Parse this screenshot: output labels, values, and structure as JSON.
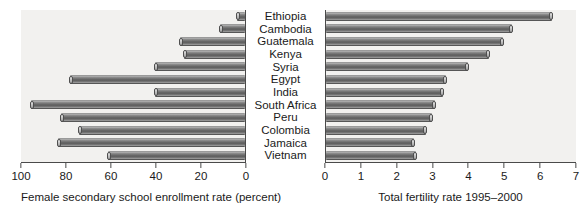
{
  "chart_data": [
    {
      "id": "female-enrollment",
      "type": "bar",
      "orientation": "horizontal",
      "direction": "right-to-left",
      "title": "",
      "xlabel": "Female secondary school enrollment rate (percent)",
      "ylabel": "",
      "xlim": [
        100,
        0
      ],
      "xticks": [
        100,
        80,
        60,
        40,
        20,
        0
      ],
      "xtick_labels": [
        "100",
        "80",
        "60",
        "40",
        "20",
        "0"
      ],
      "grid": false,
      "legend": false,
      "categories": [
        "Ethiopia",
        "Cambodia",
        "Guatemala",
        "Kenya",
        "Syria",
        "Egypt",
        "India",
        "South Africa",
        "Peru",
        "Colombia",
        "Jamaica",
        "Vietnam"
      ],
      "values": [
        3.5,
        11,
        29,
        27,
        40,
        78,
        40,
        95,
        82,
        74,
        83,
        61
      ]
    },
    {
      "id": "total-fertility",
      "type": "bar",
      "orientation": "horizontal",
      "direction": "left-to-right",
      "title": "",
      "xlabel": "Total fertility rate 1995–2000",
      "ylabel": "",
      "xlim": [
        0,
        7
      ],
      "xticks": [
        0,
        1,
        2,
        3,
        4,
        5,
        6,
        7
      ],
      "xtick_labels": [
        "0",
        "1",
        "2",
        "3",
        "4",
        "5",
        "6",
        "7"
      ],
      "grid": false,
      "legend": false,
      "categories": [
        "Ethiopia",
        "Cambodia",
        "Guatemala",
        "Kenya",
        "Syria",
        "Egypt",
        "India",
        "South Africa",
        "Peru",
        "Colombia",
        "Jamaica",
        "Vietnam"
      ],
      "values": [
        6.3,
        5.2,
        4.95,
        4.55,
        3.95,
        3.35,
        3.25,
        3.05,
        2.95,
        2.8,
        2.45,
        2.5
      ]
    }
  ],
  "left_panel": {
    "axis_title": "Female secondary school enrollment rate (percent)",
    "tick_labels": [
      "100",
      "80",
      "60",
      "40",
      "20",
      "0"
    ]
  },
  "right_panel": {
    "axis_title": "Total fertility rate 1995–2000",
    "tick_labels": [
      "0",
      "1",
      "2",
      "3",
      "4",
      "5",
      "6",
      "7"
    ]
  },
  "categories": [
    "Ethiopia",
    "Cambodia",
    "Guatemala",
    "Kenya",
    "Syria",
    "Egypt",
    "India",
    "South Africa",
    "Peru",
    "Colombia",
    "Jamaica",
    "Vietnam"
  ],
  "colors": {
    "plot_background": "#f2f1ef",
    "bar_dark": "#5c5c5c",
    "bar_light": "#b9b9b9",
    "axis": "#4a4a4a",
    "text": "#1a1a1a",
    "page_background": "#ffffff"
  }
}
